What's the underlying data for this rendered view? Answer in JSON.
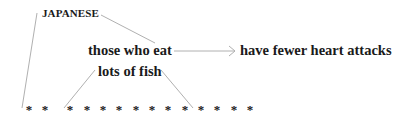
{
  "diagram": {
    "type": "syntax-tree",
    "nodes": {
      "modifier": "JAPANESE",
      "subject": "those who eat",
      "predicate": "have fewer heart attacks",
      "object": "lots of fish"
    },
    "edges": [
      {
        "from": "modifier",
        "to": "stars-left",
        "style": "line"
      },
      {
        "from": "modifier",
        "to": "subject",
        "style": "line"
      },
      {
        "from": "subject",
        "to": "predicate",
        "style": "arrow"
      },
      {
        "from": "object",
        "to": "stars-middle-left",
        "style": "line"
      },
      {
        "from": "object",
        "to": "stars-middle-right",
        "style": "line"
      }
    ],
    "stars": {
      "glyph": "*",
      "count": 14,
      "x_positions": [
        29,
        45,
        70,
        87,
        103,
        119,
        136,
        152,
        168,
        185,
        201,
        217,
        234,
        250
      ]
    },
    "colors": {
      "text": "#1a1a1a",
      "lines": "#b0b0b0",
      "background": "#ffffff"
    }
  }
}
